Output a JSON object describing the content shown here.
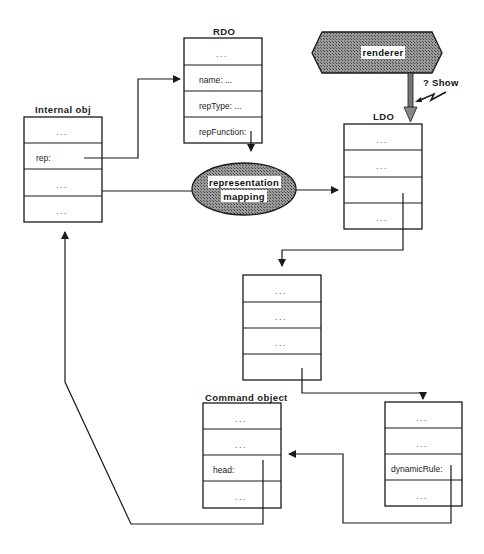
{
  "diagram": {
    "internal_obj": {
      "title": "Internal obj",
      "cells": [
        "...",
        "rep:",
        "...",
        "..."
      ]
    },
    "rdo": {
      "title": "RDO",
      "cells": [
        "...",
        "name: ...",
        "repType: ...",
        "repFunction:"
      ]
    },
    "renderer": {
      "label": "renderer"
    },
    "show_event": {
      "label": "? Show"
    },
    "ldo": {
      "title": "LDO",
      "cells": [
        "...",
        "...",
        "",
        "..."
      ]
    },
    "mapping": {
      "label_line1": "representation",
      "label_line2": "mapping"
    },
    "middle_obj": {
      "title": "",
      "cells": [
        "...",
        "...",
        "...",
        ""
      ]
    },
    "command_object": {
      "title": "Command object",
      "cells": [
        "...",
        "...",
        "head:",
        "..."
      ]
    },
    "rule_obj": {
      "title": "",
      "cells": [
        "...",
        "...",
        "dynamicRule:",
        "..."
      ]
    },
    "colors": {
      "shape_fill": "#8a8a8a",
      "line": "#1a1a1a",
      "label_bg": "#ffffff"
    }
  }
}
